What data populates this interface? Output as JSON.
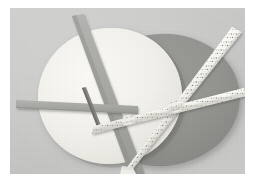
{
  "image": {
    "kind": "photograph",
    "subject": "two overlapping circular discs with crossing ribbon bands",
    "caption": ""
  },
  "canvas": {
    "width": 260,
    "height": 192,
    "margin_color": "#ffffff",
    "plate": {
      "x": 10,
      "y": 8,
      "width": 235,
      "height": 166
    }
  },
  "palette": {
    "page_margin": "#ffffff",
    "backdrop_light": "#cfcfcd",
    "backdrop_mid": "#c7c7c5",
    "backdrop_dark": "#c2c2c0",
    "cream_disc": "#f4f3ee",
    "cream_disc_shadow": "#e4e2db",
    "gray_disc": "#949490",
    "gray_disc_dark": "#8a8a86",
    "gray_ribbon": "#a9a9a5",
    "gray_ribbon_dark": "#9b9b97",
    "white_ribbon": "#f2f1ec",
    "white_ribbon_edge": "#d9d8d2",
    "perforation": "#6e6e6a",
    "pin_dark": "#7c7c78",
    "drop_shadow": "rgba(60,60,58,0.35)"
  },
  "objects": {
    "cream_disc": {
      "label": "cream disc",
      "shape": "ellipse",
      "cx": 100,
      "cy": 88,
      "rx": 72,
      "ry": 68,
      "rotation_deg": -8,
      "fill": "#f4f3ee"
    },
    "gray_disc": {
      "label": "gray disc",
      "shape": "ellipse",
      "cx": 152,
      "cy": 92,
      "rx": 78,
      "ry": 66,
      "rotation_deg": -6,
      "fill": "#949490"
    },
    "gray_ribbons": [
      {
        "label": "diagonal gray band on cream disc",
        "x1": 74,
        "y1": 16,
        "x2": 126,
        "y2": 172,
        "width": 9
      },
      {
        "label": "horizontal gray band on cream disc",
        "x1": 16,
        "y1": 96,
        "x2": 122,
        "y2": 104,
        "width": 7
      }
    ],
    "white_ribbons": [
      {
        "label": "horizontal perforated ribbon",
        "x1": 92,
        "y1": 120,
        "x2": 236,
        "y2": 88,
        "width": 8,
        "perforated": true
      },
      {
        "label": "diagonal perforated ribbon",
        "x1": 120,
        "y1": 160,
        "x2": 222,
        "y2": 30,
        "width": 8,
        "perforated": true
      }
    ],
    "pin": {
      "label": "dark pin at cream disc crossing",
      "x1": 74,
      "y1": 84,
      "x2": 90,
      "y2": 116
    }
  }
}
